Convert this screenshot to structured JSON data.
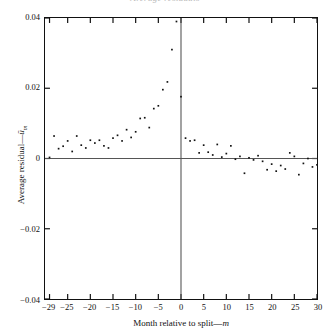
{
  "chart_data": {
    "type": "scatter",
    "title": "Average residuals",
    "xlabel": "Month relative to split—m",
    "xlabel_plain": "Month relative to split",
    "xlabel_symbol": "m",
    "ylabel": "Average residual—ūₘ",
    "ylabel_plain": "Average residual",
    "ylabel_symbol": "u",
    "ylabel_subscript": "m",
    "xlim": [
      -30,
      30
    ],
    "ylim": [
      -0.04,
      0.04
    ],
    "xticks": [
      -29,
      -25,
      -20,
      -15,
      -10,
      -5,
      0,
      5,
      10,
      15,
      20,
      25,
      30
    ],
    "xtick_labels": [
      "−29",
      "−25",
      "−20",
      "−15",
      "−10",
      "−5",
      "0",
      "5",
      "10",
      "15",
      "20",
      "25",
      "30"
    ],
    "yticks": [
      -0.04,
      -0.02,
      0,
      0.02,
      0.04
    ],
    "ytick_labels": [
      "−0.04",
      "−0.02",
      "0",
      "0.02",
      "0.04"
    ],
    "grid": false,
    "legend": false,
    "marker": "dot",
    "marker_color": "#111111",
    "marker_size": 1.7,
    "zero_line_y": 0,
    "zero_line_x": 0,
    "reference_lines": {
      "horizontal_at": 0,
      "vertical_at": 0,
      "color": "#555555"
    },
    "x": [
      -29,
      -28,
      -27,
      -26,
      -25,
      -24,
      -23,
      -22,
      -21,
      -20,
      -19,
      -18,
      -17,
      -16,
      -15,
      -14,
      -13,
      -12,
      -11,
      -10,
      -9,
      -8,
      -7,
      -6,
      -5,
      -4,
      -3,
      -2,
      -1,
      0,
      1,
      2,
      3,
      4,
      5,
      6,
      7,
      8,
      9,
      10,
      11,
      12,
      13,
      14,
      15,
      16,
      17,
      18,
      19,
      20,
      21,
      22,
      23,
      24,
      25,
      26,
      27,
      28,
      29,
      30
    ],
    "values": [
      0.0003,
      0.0064,
      0.0028,
      0.0035,
      0.005,
      0.002,
      0.0064,
      0.0038,
      0.003,
      0.0052,
      0.0044,
      0.0052,
      0.0036,
      0.003,
      0.0058,
      0.0066,
      0.005,
      0.0082,
      0.006,
      0.0076,
      0.0114,
      0.0116,
      0.0088,
      0.0142,
      0.015,
      0.0196,
      0.0218,
      0.031,
      0.039,
      0.0176,
      0.0058,
      0.005,
      0.0052,
      0.0016,
      0.0038,
      0.0018,
      0.001,
      0.004,
      0.0004,
      0.0014,
      0.0036,
      -0.0002,
      0.0006,
      -0.0042,
      0.0002,
      -0.0004,
      0.0008,
      -0.0008,
      -0.0032,
      -0.0016,
      -0.0036,
      -0.002,
      -0.003,
      0.0016,
      0.0006,
      -0.0046,
      -0.0014,
      0.0,
      -0.0024,
      -0.0018
    ]
  }
}
